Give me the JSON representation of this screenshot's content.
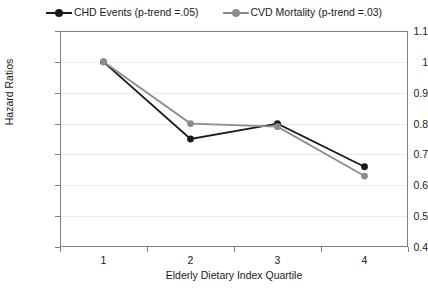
{
  "chart_data": {
    "type": "line",
    "title": "",
    "xlabel": "Elderly Dietary Index Quartile",
    "ylabel": "Hazard Ratios",
    "categories": [
      "1",
      "2",
      "3",
      "4"
    ],
    "ylim": [
      0.4,
      1.1
    ],
    "yticks": [
      "0.4",
      "0.5",
      "0.6",
      "0.7",
      "0.8",
      "0.9",
      "1",
      "1.1"
    ],
    "ytick_values": [
      0.4,
      0.5,
      0.6,
      0.7,
      0.8,
      0.9,
      1.0,
      1.1
    ],
    "grid": true,
    "legend_position": "top-center",
    "series": [
      {
        "name": "CHD Events (p-trend =.05)",
        "color": "#1a1a1a",
        "marker": "circle",
        "values": [
          1.0,
          0.75,
          0.8,
          0.66
        ]
      },
      {
        "name": "CVD Mortality (p-trend =.03)",
        "color": "#8c8c8c",
        "marker": "circle",
        "values": [
          1.0,
          0.8,
          0.79,
          0.63
        ]
      }
    ]
  },
  "legend": {
    "items": [
      {
        "label": "CHD Events (p-trend =.05)"
      },
      {
        "label": "CVD Mortality (p-trend =.03)"
      }
    ]
  },
  "axes": {
    "y_title": "Hazard Ratios",
    "x_title": "Elderly Dietary Index Quartile"
  },
  "colors": {
    "series_1": "#1a1a1a",
    "series_2": "#8c8c8c",
    "grid": "#ebebeb",
    "border": "#808080",
    "background": "#ffffff"
  }
}
